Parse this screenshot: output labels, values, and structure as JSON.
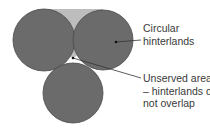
{
  "diagram": {
    "labels": {
      "circular_line1": "Circular",
      "circular_line2": "hinterlands",
      "unserved_line1": "Unserved areas",
      "unserved_line2": "– hinterlands do",
      "unserved_line3": "not overlap"
    },
    "colors": {
      "circle_fill": "#6b6b6b",
      "circle_stroke": "#4a4a4a",
      "gap_fill": "#bdbdbd",
      "leader_line": "#333333",
      "text": "#3a3a3a"
    }
  }
}
